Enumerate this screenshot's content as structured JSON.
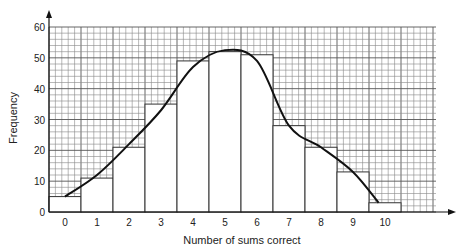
{
  "chart_data": {
    "type": "bar",
    "subtype": "histogram-with-frequency-curve",
    "title": "",
    "xlabel": "Number of sums correct",
    "ylabel": "Frequency",
    "categories": [
      "0",
      "1",
      "2",
      "3",
      "4",
      "5",
      "6",
      "7",
      "8",
      "9",
      "10"
    ],
    "values": [
      5,
      11,
      21,
      35,
      49,
      52,
      51,
      28,
      21,
      13,
      3
    ],
    "curve": {
      "description": "smooth frequency curve drawn over histogram",
      "points": [
        [
          0,
          5
        ],
        [
          1,
          12
        ],
        [
          2,
          22
        ],
        [
          3,
          33
        ],
        [
          4,
          47
        ],
        [
          5,
          52.5
        ],
        [
          6,
          49
        ],
        [
          7,
          28
        ],
        [
          8,
          21
        ],
        [
          9,
          13
        ],
        [
          9.8,
          3
        ]
      ]
    },
    "yticks": [
      0,
      10,
      20,
      30,
      40,
      50,
      60
    ],
    "ylim": [
      0,
      60
    ],
    "xlim": [
      -0.5,
      11.5
    ],
    "grid": true,
    "grid_style": "fine square graph paper, 1 minor unit = 2 frequency",
    "legend": null
  }
}
